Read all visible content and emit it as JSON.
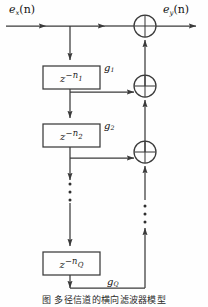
{
  "figure": {
    "type": "signal-flow-block-diagram",
    "caption": "图    多径信道的横向滤波器模型",
    "input_label": {
      "base": "e",
      "sub": "x",
      "arg": "(n)"
    },
    "output_label": {
      "base": "e",
      "sub": "y",
      "arg": "(n)"
    },
    "delay_blocks": [
      {
        "id": "blk-0",
        "text": "z−n₁",
        "base": "z",
        "exp": "−n",
        "exp_sub": "1"
      },
      {
        "id": "blk-1",
        "text": "z−n₂",
        "base": "z",
        "exp": "−n",
        "exp_sub": "2"
      },
      {
        "id": "blk-2",
        "text": "z−n_Q",
        "base": "z",
        "exp": "−n",
        "exp_sub": "Q"
      }
    ],
    "tap_gains": [
      {
        "id": "g1",
        "base": "g",
        "sub": "1"
      },
      {
        "id": "g2",
        "base": "g",
        "sub": "2"
      },
      {
        "id": "gQ",
        "base": "g",
        "sub": "Q"
      }
    ],
    "adders": [
      {
        "id": "adder-top",
        "cx": 145,
        "cy": 26,
        "r": 11
      },
      {
        "id": "adder-mid",
        "cx": 145,
        "cy": 86,
        "r": 11
      },
      {
        "id": "adder-bottom",
        "cx": 145,
        "cy": 152,
        "r": 11
      }
    ],
    "ellipsis": [
      {
        "id": "ellipsis-delay-chain",
        "x": 70,
        "dots": 3
      },
      {
        "id": "ellipsis-adder-chain",
        "x": 145,
        "dots": 3
      }
    ],
    "colors": {
      "stroke": "#3a3a3a",
      "background": "#fefefe",
      "text": "#111111"
    }
  }
}
